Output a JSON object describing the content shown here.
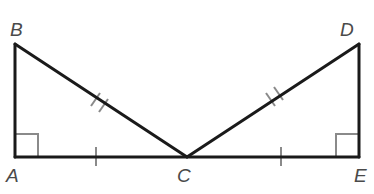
{
  "diagram": {
    "type": "geometry",
    "colors": {
      "segment": "#1a1a1a",
      "marker": "#8a8a8a",
      "label": "#4a4a4a",
      "background": "#ffffff"
    },
    "points": {
      "A": {
        "label": "A",
        "x": 15,
        "y": 157
      },
      "B": {
        "label": "B",
        "x": 15,
        "y": 44
      },
      "C": {
        "label": "C",
        "x": 187,
        "y": 157
      },
      "D": {
        "label": "D",
        "x": 359,
        "y": 44
      },
      "E": {
        "label": "E",
        "x": 359,
        "y": 157
      }
    },
    "segments": [
      {
        "from": "A",
        "to": "B"
      },
      {
        "from": "B",
        "to": "C"
      },
      {
        "from": "A",
        "to": "C"
      },
      {
        "from": "C",
        "to": "E"
      },
      {
        "from": "C",
        "to": "D"
      },
      {
        "from": "D",
        "to": "E"
      }
    ],
    "right_angles": [
      "A",
      "E"
    ],
    "congruence_marks": [
      {
        "segment": "AC",
        "ticks": 1
      },
      {
        "segment": "CE",
        "ticks": 1
      },
      {
        "segment": "BC",
        "ticks": 2
      },
      {
        "segment": "CD",
        "ticks": 2
      }
    ]
  }
}
